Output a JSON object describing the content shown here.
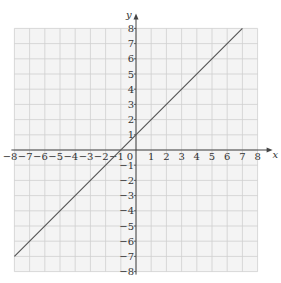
{
  "chart_data": {
    "type": "line",
    "title": "",
    "xlabel": "x",
    "ylabel": "y",
    "xlim": [
      -8,
      8
    ],
    "ylim": [
      -8,
      8
    ],
    "grid": true,
    "x_ticks": [
      -8,
      -7,
      -6,
      -5,
      -4,
      -3,
      -2,
      -1,
      0,
      1,
      2,
      3,
      4,
      5,
      6,
      7,
      8
    ],
    "y_ticks": [
      -8,
      -7,
      -6,
      -5,
      -4,
      -3,
      -2,
      -1,
      1,
      2,
      3,
      4,
      5,
      6,
      7,
      8
    ],
    "series": [
      {
        "name": "y = x + 1",
        "x": [
          -8,
          7
        ],
        "y": [
          -7,
          8
        ]
      }
    ],
    "colors": {
      "line": "#555555",
      "grid": "#cfcfcf",
      "axis": "#444444",
      "background": "#f4f4f4"
    }
  }
}
